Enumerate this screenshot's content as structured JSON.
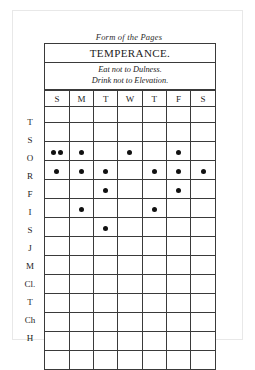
{
  "document": {
    "caption": "Form of the Pages",
    "title": "TEMPERANCE.",
    "motto_line_1": "Eat not to Dulness.",
    "motto_line_2": "Drink not to Elevation."
  },
  "table": {
    "day_headers": [
      "S",
      "M",
      "T",
      "W",
      "T",
      "F",
      "S"
    ],
    "virtue_initials": [
      "T",
      "S",
      "O",
      "R",
      "F",
      "I",
      "S",
      "J",
      "M",
      "Cl.",
      "T",
      "Ch",
      "H"
    ],
    "marks": [
      [
        0,
        0,
        0,
        0,
        0,
        0,
        0
      ],
      [
        2,
        1,
        0,
        1,
        0,
        1,
        0
      ],
      [
        1,
        1,
        1,
        0,
        1,
        1,
        1
      ],
      [
        0,
        0,
        1,
        0,
        0,
        1,
        0
      ],
      [
        0,
        1,
        0,
        0,
        1,
        0,
        0
      ],
      [
        0,
        0,
        1,
        0,
        0,
        0,
        0
      ],
      [
        0,
        0,
        0,
        0,
        0,
        0,
        0
      ],
      [
        0,
        0,
        0,
        0,
        0,
        0,
        0
      ],
      [
        0,
        0,
        0,
        0,
        0,
        0,
        0
      ],
      [
        0,
        0,
        0,
        0,
        0,
        0,
        0
      ],
      [
        0,
        0,
        0,
        0,
        0,
        0,
        0
      ],
      [
        0,
        0,
        0,
        0,
        0,
        0,
        0
      ],
      [
        0,
        0,
        0,
        0,
        0,
        0,
        0
      ]
    ],
    "mark_color": "#111111",
    "rule_color": "#3a3a3a"
  }
}
